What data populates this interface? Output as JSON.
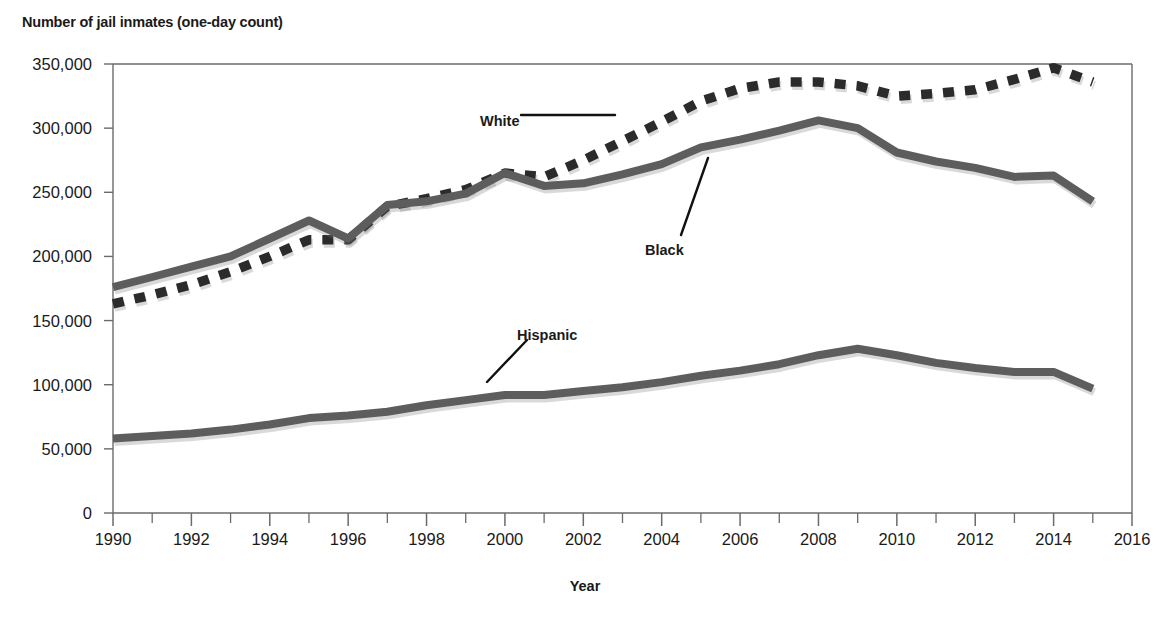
{
  "chart_data": {
    "type": "line",
    "title": "Number of jail inmates (one-day count)",
    "ylabel": "Number of jail inmates (one-day count)",
    "xlabel": "Year",
    "xlim": [
      1990,
      2016
    ],
    "ylim": [
      0,
      350000
    ],
    "grid": false,
    "legend_position": "inline-annotations",
    "x_major_ticks": [
      "1990",
      "1992",
      "1994",
      "1996",
      "1998",
      "2000",
      "2002",
      "2004",
      "2006",
      "2008",
      "2010",
      "2012",
      "2014",
      "2016"
    ],
    "x_minor_ticks": [
      "1991",
      "1993",
      "1995",
      "1997",
      "1999",
      "2001",
      "2003",
      "2005",
      "2007",
      "2009",
      "2011",
      "2013",
      "2015"
    ],
    "y_ticks": [
      "0",
      "50,000",
      "100,000",
      "150,000",
      "200,000",
      "250,000",
      "300,000",
      "350,000"
    ],
    "y_tick_values": [
      0,
      50000,
      100000,
      150000,
      200000,
      250000,
      300000,
      350000
    ],
    "x": [
      1990,
      1991,
      1992,
      1993,
      1994,
      1995,
      1996,
      1997,
      1998,
      1999,
      2000,
      2001,
      2002,
      2003,
      2004,
      2005,
      2006,
      2007,
      2008,
      2009,
      2010,
      2011,
      2012,
      2013,
      2014,
      2015
    ],
    "series": [
      {
        "name": "White",
        "style": "dashed",
        "color": "#2b2b2b",
        "values": [
          163000,
          170000,
          178000,
          188000,
          200000,
          213000,
          213000,
          239000,
          245000,
          252000,
          265000,
          262000,
          275000,
          290000,
          305000,
          321000,
          331000,
          336000,
          336000,
          333000,
          325000,
          327000,
          330000,
          338000,
          347000,
          336000
        ]
      },
      {
        "name": "Black",
        "style": "solid",
        "color": "#5d5d5d",
        "values": [
          176000,
          184000,
          192000,
          200000,
          214000,
          228000,
          214000,
          240000,
          243000,
          249000,
          265000,
          255000,
          257000,
          264000,
          272000,
          285000,
          291000,
          298000,
          306000,
          300000,
          281000,
          274000,
          269000,
          262000,
          263000,
          243000
        ]
      },
      {
        "name": "Hispanic",
        "style": "solid",
        "color": "#5d5d5d",
        "values": [
          58000,
          60000,
          62000,
          65000,
          69000,
          74000,
          76000,
          79000,
          84000,
          88000,
          92000,
          92000,
          95000,
          98000,
          102000,
          107000,
          111000,
          116000,
          123000,
          128000,
          123000,
          117000,
          113000,
          110000,
          110000,
          97000
        ]
      }
    ],
    "annotations": [
      {
        "label": "White",
        "text_x": 480,
        "text_y": 113,
        "leader": [
          [
            521,
            115
          ],
          [
            615,
            115
          ]
        ]
      },
      {
        "label": "Black",
        "text_x": 645,
        "text_y": 242,
        "leader": [
          [
            681,
            235
          ],
          [
            708,
            158
          ]
        ]
      },
      {
        "label": "Hispanic",
        "text_x": 517,
        "text_y": 327,
        "leader": [
          [
            527,
            340
          ],
          [
            487,
            382
          ]
        ]
      },
      {
        "label": "Hispanic_leader_note",
        "text_x": 0,
        "text_y": 0,
        "leader": []
      }
    ]
  },
  "plot_geometry": {
    "left": 113,
    "right": 1132,
    "top": 64,
    "bottom": 513
  }
}
